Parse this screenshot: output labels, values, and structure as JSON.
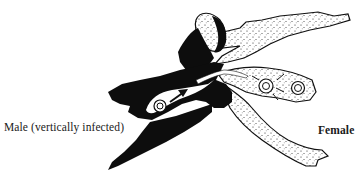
{
  "labels": {
    "male": "Male (vertically infected)",
    "female": "Female"
  },
  "colors": {
    "male_fill": "#0d0d0d",
    "female_fill": "#ffffff",
    "female_stipple": "#1a1a1a",
    "outline": "#111111",
    "background": "#ffffff"
  },
  "elements": {
    "transfer_arrow": "arrow pointing from male toward female",
    "particles": [
      "male-particle",
      "female-particle-1",
      "female-particle-2"
    ]
  }
}
